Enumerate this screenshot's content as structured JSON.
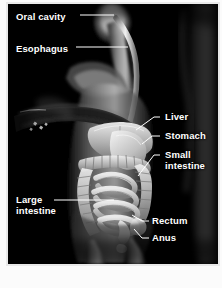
{
  "figure": {
    "type": "anatomical-illustration",
    "background_color": "#000000",
    "label_color": "#ffffff",
    "frame_color": "#e9e9e9",
    "page_background": "#fbfbfb"
  },
  "labels": [
    {
      "id": "oral-cavity",
      "text": "Oral cavity",
      "lines": [
        "Oral cavity"
      ],
      "x": 14,
      "y": 12,
      "align": "left"
    },
    {
      "id": "esophagus",
      "text": "Esophagus",
      "lines": [
        "Esophagus"
      ],
      "x": 14,
      "y": 44,
      "align": "left"
    },
    {
      "id": "liver",
      "text": "Liver",
      "lines": [
        "Liver"
      ],
      "x": 163,
      "y": 112,
      "align": "left"
    },
    {
      "id": "stomach",
      "text": "Stomach",
      "lines": [
        "Stomach"
      ],
      "x": 163,
      "y": 131,
      "align": "left"
    },
    {
      "id": "small-intestine",
      "text": "Small intestine",
      "lines": [
        "Small",
        "intestine"
      ],
      "x": 163,
      "y": 150,
      "align": "left"
    },
    {
      "id": "large-intestine",
      "text": "Large intestine",
      "lines": [
        "Large",
        "intestine"
      ],
      "x": 14,
      "y": 195,
      "align": "left"
    },
    {
      "id": "rectum",
      "text": "Rectum",
      "lines": [
        "Rectum"
      ],
      "x": 150,
      "y": 216,
      "align": "left"
    },
    {
      "id": "anus",
      "text": "Anus",
      "lines": [
        "Anus"
      ],
      "x": 150,
      "y": 233,
      "align": "left"
    }
  ],
  "leader_lines": [
    {
      "id": "leader-oral-cavity",
      "from": [
        78,
        17
      ],
      "to": [
        118,
        17
      ]
    },
    {
      "id": "leader-esophagus",
      "from": [
        74,
        49
      ],
      "to": [
        130,
        49
      ]
    },
    {
      "id": "leader-liver",
      "from": [
        152,
        117
      ],
      "to": [
        128,
        128
      ]
    },
    {
      "id": "leader-stomach",
      "from": [
        152,
        136
      ],
      "to": [
        140,
        140
      ]
    },
    {
      "id": "leader-small-intestine",
      "from": [
        152,
        155
      ],
      "to": [
        138,
        172
      ]
    },
    {
      "id": "leader-large-intestine",
      "from": [
        52,
        200
      ],
      "to": [
        110,
        200
      ]
    },
    {
      "id": "leader-rectum",
      "from": [
        139,
        221
      ],
      "to": [
        126,
        214
      ]
    },
    {
      "id": "leader-anus",
      "from": [
        139,
        238
      ],
      "to": [
        127,
        228
      ]
    }
  ],
  "organs": [
    {
      "id": "oral-cavity",
      "name": "Oral cavity"
    },
    {
      "id": "esophagus",
      "name": "Esophagus"
    },
    {
      "id": "liver",
      "name": "Liver"
    },
    {
      "id": "stomach",
      "name": "Stomach"
    },
    {
      "id": "small-intestine",
      "name": "Small intestine"
    },
    {
      "id": "large-intestine",
      "name": "Large intestine"
    },
    {
      "id": "rectum",
      "name": "Rectum"
    },
    {
      "id": "anus",
      "name": "Anus"
    }
  ]
}
